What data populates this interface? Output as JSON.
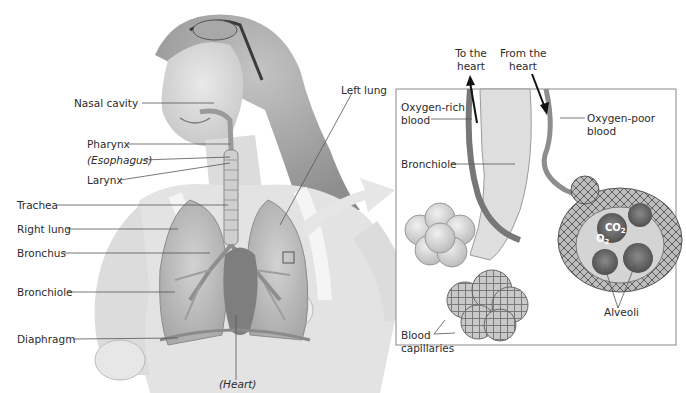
{
  "figure": {
    "palette": {
      "background": "#ffffff",
      "label_text": "#2b2b2b",
      "leader_line": "#555555",
      "illustration_gray": "#9a9a9a",
      "inset_border": "#8a8a8a",
      "arrow_callout": "#e6e6e6"
    },
    "body_labels": [
      {
        "id": "nasal-cavity",
        "text": "Nasal cavity",
        "italic": false
      },
      {
        "id": "pharynx",
        "text": "Pharynx",
        "italic": false
      },
      {
        "id": "esophagus",
        "text": "(Esophagus)",
        "italic": true
      },
      {
        "id": "larynx",
        "text": "Larynx",
        "italic": false
      },
      {
        "id": "trachea",
        "text": "Trachea",
        "italic": false
      },
      {
        "id": "right-lung",
        "text": "Right lung",
        "italic": false
      },
      {
        "id": "bronchus",
        "text": "Bronchus",
        "italic": false
      },
      {
        "id": "bronchiole",
        "text": "Bronchiole",
        "italic": false
      },
      {
        "id": "diaphragm",
        "text": "Diaphragm",
        "italic": false
      },
      {
        "id": "heart",
        "text": "(Heart)",
        "italic": true
      },
      {
        "id": "left-lung",
        "text": "Left lung",
        "italic": false
      }
    ],
    "inset": {
      "title": "Magnified view of bronchiole and alveoli",
      "arrows": [
        {
          "id": "to-heart",
          "text_line1": "To the",
          "text_line2": "heart",
          "direction": "up"
        },
        {
          "id": "from-heart",
          "text_line1": "From the",
          "text_line2": "heart",
          "direction": "down"
        }
      ],
      "labels": [
        {
          "id": "oxygen-rich",
          "text_line1": "Oxygen-rich",
          "text_line2": "blood"
        },
        {
          "id": "oxygen-poor",
          "text_line1": "Oxygen-poor",
          "text_line2": "blood"
        },
        {
          "id": "inset-bronchiole",
          "text_line1": "Bronchiole",
          "text_line2": ""
        },
        {
          "id": "alveoli",
          "text_line1": "Alveoli",
          "text_line2": ""
        },
        {
          "id": "blood-capillaries",
          "text_line1": "Blood",
          "text_line2": "capillaries"
        }
      ],
      "gases": {
        "co2": {
          "base": "CO",
          "sub": "2"
        },
        "o2": {
          "base": "O",
          "sub": "2"
        }
      }
    }
  }
}
